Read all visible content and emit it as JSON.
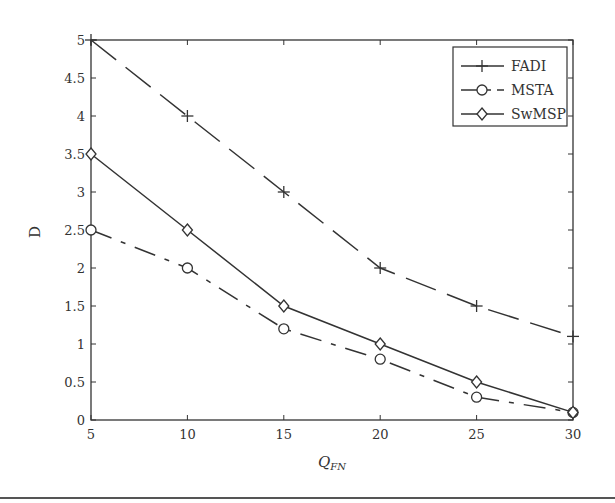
{
  "chart_data": {
    "type": "line",
    "title": "",
    "xlabel": "Q_FN",
    "xlabel_main": "Q",
    "xlabel_sub": "FN",
    "ylabel": "D",
    "x": [
      5,
      10,
      15,
      20,
      25,
      30
    ],
    "xlim": [
      5,
      30
    ],
    "ylim": [
      0,
      5
    ],
    "xticks": [
      "5",
      "10",
      "15",
      "20",
      "25",
      "30"
    ],
    "yticks": [
      "0",
      "0.5",
      "1",
      "1.5",
      "2",
      "2.5",
      "3",
      "3.5",
      "4",
      "4.5",
      "5"
    ],
    "grid": false,
    "legend_position": "upper right",
    "series": [
      {
        "name": "FADI",
        "values": [
          5,
          4,
          3,
          2,
          1.5,
          1.1
        ],
        "marker": "plus",
        "linestyle": "long-dash",
        "color": "#333333"
      },
      {
        "name": "MSTA",
        "values": [
          2.5,
          2,
          1.2,
          0.8,
          0.3,
          0.1
        ],
        "marker": "circle",
        "linestyle": "dash-dot",
        "color": "#333333"
      },
      {
        "name": "SwMSP",
        "values": [
          3.5,
          2.5,
          1.5,
          1,
          0.5,
          0.1
        ],
        "marker": "diamond",
        "linestyle": "solid",
        "color": "#333333"
      }
    ]
  }
}
